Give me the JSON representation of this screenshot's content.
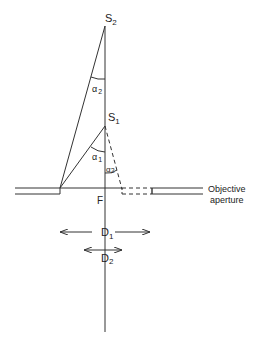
{
  "diagram": {
    "points": {
      "s2": {
        "label": "S",
        "sub": "2"
      },
      "s1": {
        "label": "S",
        "sub": "1"
      },
      "focus": {
        "label": "F"
      }
    },
    "angles": {
      "alpha2_upper": {
        "label": "α",
        "sub": "2"
      },
      "alpha1": {
        "label": "α",
        "sub": "1"
      },
      "alpha2_lower": {
        "label": "α",
        "sub": "2"
      }
    },
    "dimensions": {
      "d1": {
        "label": "D",
        "sub": "1"
      },
      "d2": {
        "label": "D",
        "sub": "2"
      }
    },
    "aperture_label": {
      "line1": "Objective",
      "line2": "aperture"
    },
    "colors": {
      "line": "#333333",
      "background": "#ffffff"
    }
  }
}
